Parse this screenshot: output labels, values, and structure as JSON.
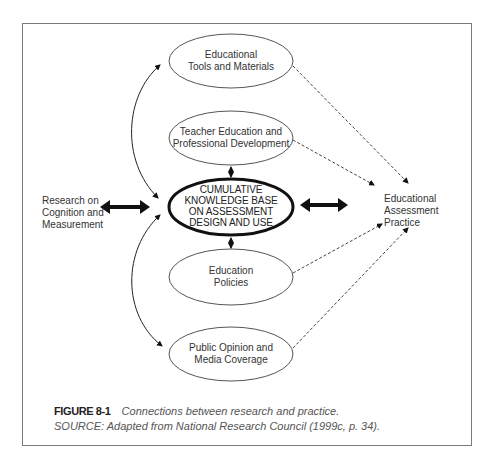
{
  "diagram": {
    "nodes": {
      "tools": {
        "line1": "Educational",
        "line2": "Tools and Materials"
      },
      "teacher": {
        "line1": "Teacher Education and",
        "line2": "Professional Development"
      },
      "core": {
        "line1": "CUMULATIVE",
        "line2": "KNOWLEDGE BASE",
        "line3": "ON ASSESSMENT",
        "line4": "DESIGN AND USE"
      },
      "policies": {
        "line1": "Education",
        "line2": "Policies"
      },
      "public": {
        "line1": "Public Opinion and",
        "line2": "Media Coverage"
      }
    },
    "research": {
      "line1": "Research on",
      "line2": "Cognition and",
      "line3": "Measurement"
    },
    "practice": {
      "line1": "Educational",
      "line2": "Assessment",
      "line3": "Practice"
    },
    "edges": [
      {
        "from": "research",
        "to": "core",
        "style": "thick-bidirectional"
      },
      {
        "from": "core",
        "to": "practice",
        "style": "thick-bidirectional"
      },
      {
        "from": "core",
        "to": "tools",
        "style": "curved-bidirectional"
      },
      {
        "from": "core",
        "to": "public",
        "style": "curved-bidirectional"
      },
      {
        "from": "teacher",
        "to": "core",
        "style": "short-bidirectional"
      },
      {
        "from": "core",
        "to": "policies",
        "style": "short-bidirectional"
      },
      {
        "from": "tools",
        "to": "practice",
        "style": "dashed-arrow"
      },
      {
        "from": "teacher",
        "to": "practice",
        "style": "dashed-arrow"
      },
      {
        "from": "policies",
        "to": "practice",
        "style": "dashed-arrow"
      },
      {
        "from": "public",
        "to": "practice",
        "style": "dashed-arrow"
      }
    ]
  },
  "caption": {
    "figure_number": "FIGURE 8-1",
    "figure_text": "Connections between research and practice.",
    "source": "SOURCE:  Adapted from National Research Council (1999c, p. 34)."
  }
}
